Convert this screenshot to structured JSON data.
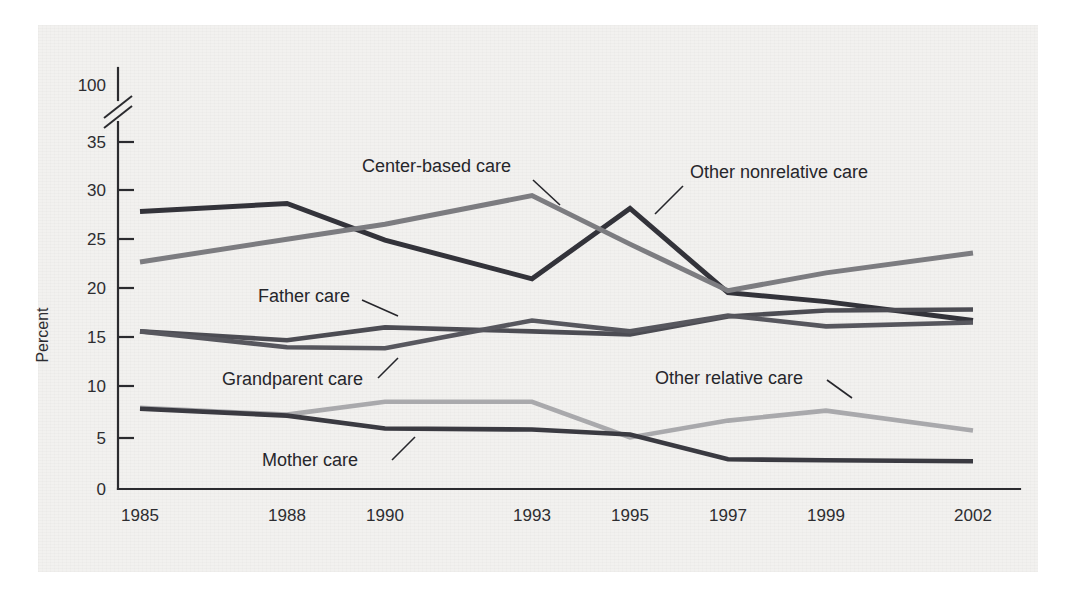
{
  "figure": {
    "background_color": "#f2f1ef",
    "page_color": "#ffffff"
  },
  "chart_data": {
    "type": "line",
    "title": "",
    "subtitle": "",
    "xlabel": "",
    "ylabel": "Percent",
    "x": [
      "1985",
      "1988",
      "1990",
      "1993",
      "1995",
      "1997",
      "1999",
      "2002"
    ],
    "categories": [
      "1985",
      "1988",
      "1990",
      "1993",
      "1995",
      "1997",
      "1999",
      "2002"
    ],
    "xtick_labels": [
      "1985",
      "1988",
      "1990",
      "1993",
      "1995",
      "1997",
      "1999",
      "2002"
    ],
    "ytick_labels": [
      "0",
      "5",
      "10",
      "15",
      "20",
      "25",
      "30",
      "35",
      "100"
    ],
    "ytick_values": [
      0,
      5,
      10,
      15,
      20,
      25,
      30,
      35,
      100
    ],
    "ylim": [
      0,
      35
    ],
    "axis_break": {
      "present": true,
      "between": [
        35,
        100
      ],
      "style": "double-slash"
    },
    "grid": false,
    "legend_position": "inline-annotations",
    "series": [
      {
        "name": "Other nonrelative care",
        "color": "#33333a",
        "width": 5.0,
        "values": [
          28.0,
          28.8,
          25.1,
          21.2,
          28.3,
          19.8,
          18.9,
          17.0
        ]
      },
      {
        "name": "Center-based care",
        "color": "#7c7c80",
        "width": 5.0,
        "values": [
          22.9,
          25.2,
          26.7,
          29.6,
          24.7,
          20.0,
          21.8,
          23.8
        ]
      },
      {
        "name": "Father care",
        "color": "#4c4c53",
        "width": 4.6,
        "values": [
          15.9,
          15.0,
          16.3,
          15.9,
          15.6,
          17.4,
          18.0,
          18.1
        ]
      },
      {
        "name": "Grandparent care",
        "color": "#57575e",
        "width": 4.6,
        "values": [
          15.9,
          14.3,
          14.2,
          17.0,
          15.9,
          17.5,
          16.4,
          16.8
        ]
      },
      {
        "name": "Other relative care",
        "color": "#a9a9ac",
        "width": 4.6,
        "values": [
          8.2,
          7.5,
          8.8,
          8.8,
          5.2,
          6.9,
          7.9,
          5.9
        ]
      },
      {
        "name": "Mother care",
        "color": "#3a3a41",
        "width": 4.6,
        "values": [
          8.1,
          7.4,
          6.1,
          6.0,
          5.5,
          3.0,
          2.9,
          2.8
        ]
      }
    ],
    "annotations": [
      {
        "id": "center-based-care",
        "text": "Center-based care",
        "target_x": "1993",
        "target_y": 29.6
      },
      {
        "id": "other-nonrelative-care",
        "text": "Other nonrelative care",
        "target_x": "1995",
        "target_y": 28.3
      },
      {
        "id": "father-care",
        "text": "Father care",
        "target_x": "1990",
        "target_y": 16.3
      },
      {
        "id": "grandparent-care",
        "text": "Grandparent care",
        "target_x": "1990",
        "target_y": 14.2
      },
      {
        "id": "other-relative-care",
        "text": "Other relative care",
        "target_x": "1999",
        "target_y": 7.9
      },
      {
        "id": "mother-care",
        "text": "Mother care",
        "target_x": "1990",
        "target_y": 6.1
      }
    ]
  },
  "axis": {
    "y_label_text": "Percent",
    "y_ticks": [
      {
        "label": "100",
        "y": 85
      },
      {
        "label": "35",
        "y": 142
      },
      {
        "label": "30",
        "y": 190
      },
      {
        "label": "25",
        "y": 239
      },
      {
        "label": "20",
        "y": 288
      },
      {
        "label": "15",
        "y": 337
      },
      {
        "label": "10",
        "y": 386
      },
      {
        "label": "5",
        "y": 438
      },
      {
        "label": "0",
        "y": 489
      }
    ],
    "x_ticks": [
      {
        "label": "1985",
        "x": 140
      },
      {
        "label": "1988",
        "x": 287
      },
      {
        "label": "1990",
        "x": 385
      },
      {
        "label": "1993",
        "x": 532
      },
      {
        "label": "1995",
        "x": 630
      },
      {
        "label": "1997",
        "x": 728
      },
      {
        "label": "1999",
        "x": 826
      },
      {
        "label": "2002",
        "x": 973
      }
    ]
  }
}
